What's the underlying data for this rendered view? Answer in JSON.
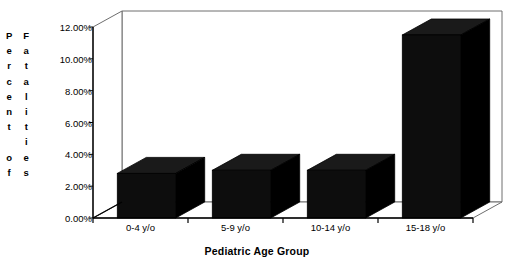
{
  "chart_data": {
    "type": "bar",
    "title": "",
    "subtitle": "",
    "xlabel": "Pediatric Age Group",
    "ylabel": "Percent of Fatalities",
    "categories": [
      "0-4 y/o",
      "5-9 y/o",
      "10-14 y/o",
      "15-18 y/o"
    ],
    "values": [
      2.8,
      3.0,
      3.0,
      11.5
    ],
    "ylim": [
      0,
      12
    ],
    "ytick_values": [
      0,
      2,
      4,
      6,
      8,
      10,
      12
    ],
    "ytick_labels": [
      "0.00%",
      "2.00%",
      "4.00%",
      "6.00%",
      "8.00%",
      "10.00%",
      "12.00%"
    ],
    "grid": false,
    "legend": null,
    "legend_position": "none",
    "style": "3d-column",
    "bar_color": "#0d0d0d",
    "bar_top_color": "#1a1a1a",
    "bar_side_color": "#000000",
    "frame_color": "#6e6e6e",
    "axis_color": "#000000",
    "background": "#ffffff"
  },
  "axis_titles": {
    "y_left_column": [
      "P",
      "e",
      "r",
      "c",
      "e",
      "n",
      "t",
      "",
      "o",
      "f"
    ],
    "y_right_column": [
      "F",
      "a",
      "t",
      "a",
      "l",
      "i",
      "t",
      "i",
      "e",
      "s"
    ]
  }
}
